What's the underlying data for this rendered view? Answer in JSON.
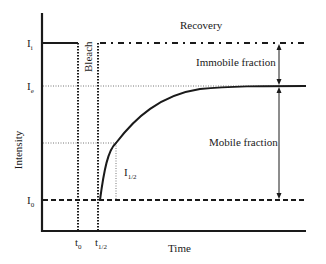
{
  "diagram": {
    "type": "FRAP recovery curve schematic",
    "axes": {
      "y_label": "Intensity",
      "x_label": "Time"
    },
    "y_ticks": [
      {
        "id": "Ii",
        "base": "I",
        "sub": "i"
      },
      {
        "id": "Ie",
        "base": "I",
        "sub": "e"
      },
      {
        "id": "I0",
        "base": "I",
        "sub": "0"
      }
    ],
    "x_ticks": [
      {
        "id": "t0",
        "base": "t",
        "sub": "0"
      },
      {
        "id": "thalf",
        "base": "t",
        "sub": "1/2"
      }
    ],
    "annotations": {
      "recovery": "Recovery",
      "bleach": "Bleach",
      "immobile_fraction": "Immobile fraction",
      "mobile_fraction": "Mobile fraction",
      "half_intensity": {
        "base": "I",
        "sub": "1/2"
      }
    },
    "colors": {
      "line": "#1a1a1a",
      "dotted": "#555555",
      "background": "#ffffff"
    }
  }
}
